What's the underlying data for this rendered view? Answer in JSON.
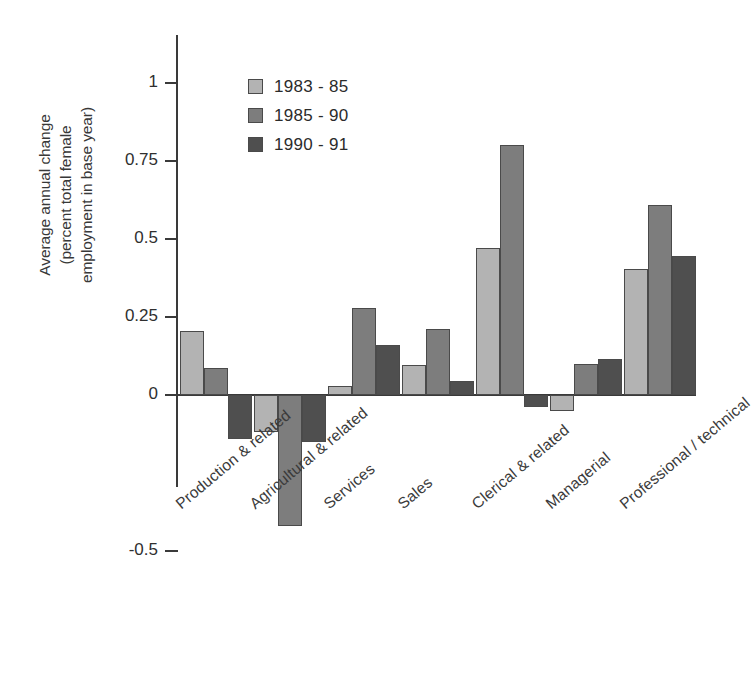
{
  "chart_data": {
    "type": "bar",
    "title": "",
    "xlabel": "",
    "ylabel": "Average annual change (percent total female employment in base year)",
    "ylabel_lines": [
      "Average annual change",
      "(percent total female",
      "employment in base year)"
    ],
    "categories": [
      "Production & related",
      "Agricultural & related",
      "Services",
      "Sales",
      "Clerical & related",
      "Managerial",
      "Professional / technical"
    ],
    "series": [
      {
        "name": "1983 - 85",
        "color": "#b3b3b3",
        "values": [
          0.205,
          -0.12,
          0.03,
          0.095,
          0.47,
          -0.05,
          0.405
        ]
      },
      {
        "name": "1985 - 90",
        "color": "#7d7d7d",
        "values": [
          0.085,
          -0.42,
          0.28,
          0.21,
          0.8,
          0.1,
          0.61
        ]
      },
      {
        "name": "1990 - 91",
        "color": "#4f4f4f",
        "values": [
          -0.14,
          -0.15,
          0.16,
          0.045,
          -0.04,
          0.115,
          0.445
        ]
      }
    ],
    "ylim": [
      -0.5,
      1
    ],
    "yticks": [
      1,
      0.75,
      0.5,
      0.25,
      0,
      -0.5
    ],
    "ytick_labels": [
      "1",
      "0.75",
      "0.5",
      "0.25",
      "0",
      "-0.5"
    ],
    "grid": false,
    "legend_position": "top-center-left",
    "legend_entries": [
      "1983 - 85",
      "1985 - 90",
      "1990 - 91"
    ]
  },
  "caption": ""
}
